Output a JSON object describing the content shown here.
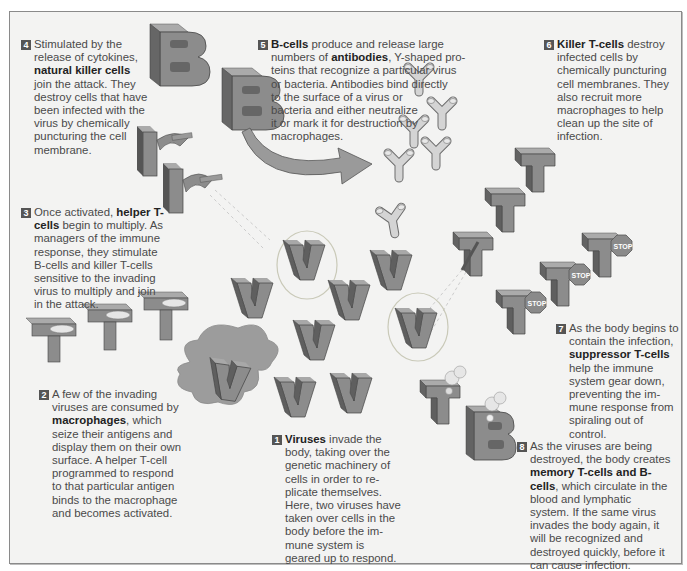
{
  "colors": {
    "background": "#f3f3f2",
    "frame_border": "#8a8a8a",
    "block_face": "#8e8e8e",
    "block_side": "#6a6a6a",
    "block_top": "#a9a9a9",
    "antibody": "#d2d2d2",
    "macrophage": "#9a9a9a",
    "text": "#4a4a4a",
    "bold_text": "#222222"
  },
  "steps": [
    {
      "number": "1",
      "parts": [
        {
          "bold": "Viruses"
        },
        {
          "text": " invade the body, taking over the genetic machinery of cells in order to replicate themselves. Here, two viruses have taken over cells in the body before the immune system is geared up to respond."
        }
      ],
      "lines": [
        "Viruses invade the",
        "body, taking over the",
        "genetic machinery of",
        "cells in order to re-",
        "plicate themselves.",
        "Here, two viruses have",
        "taken over cells in the",
        "body before the im-",
        "mune system is",
        "geared up to respond."
      ]
    },
    {
      "number": "2",
      "lines": [
        "A few of the invading",
        "viruses are consumed by",
        "macrophages, which",
        "seize their antigens and",
        "display them on their own",
        "surface. A helper T-cell",
        "programmed to respond",
        "to that particular antigen",
        "binds to the macrophage",
        "and becomes activated."
      ],
      "bold_term": "macrophages"
    },
    {
      "number": "3",
      "lines": [
        "Once activated, helper T-",
        "cells begin to multiply. As",
        "managers of the immune",
        "response, they stimulate",
        "B-cells and killer T-cells",
        "sensitive to the invading",
        "virus to multiply and join",
        "in the attack."
      ],
      "bold_term": "helper T-cells"
    },
    {
      "number": "4",
      "lines": [
        "Stimulated by the",
        "release of cytokines,",
        "natural killer cells",
        "join the attack. They",
        "destroy cells that have",
        "been infected with the",
        "virus by chemically",
        "puncturing the cell",
        "membrane."
      ],
      "bold_term": "natural killer cells"
    },
    {
      "number": "5",
      "lines": [
        "B-cells produce and release large",
        "numbers of antibodies, Y-shaped pro-",
        "teins that recognize a particular virus",
        "or bacteria. Antibodies bind directly",
        "to the surface of a virus or",
        "bacteria and either neutralize",
        "it or mark it for destruction by",
        "macrophages."
      ],
      "bold_terms": [
        "B-cells",
        "antibodies"
      ]
    },
    {
      "number": "6",
      "lines": [
        "Killer T-cells destroy",
        "infected cells by",
        "chemically puncturing",
        "cell membranes. They",
        "also recruit more",
        "macrophages to help",
        "clean up the site of",
        "infection."
      ],
      "bold_term": "Killer T-cells"
    },
    {
      "number": "7",
      "lines": [
        "As the body begins to",
        "contain the infection,",
        "suppressor T-cells",
        "help the immune",
        "system gear down,",
        "preventing the im-",
        "mune response from",
        "spiraling out of control."
      ],
      "bold_term": "suppressor T-cells"
    },
    {
      "number": "8",
      "lines": [
        "As the viruses are being",
        "destroyed, the body creates",
        "memory T-cells and B-",
        "cells, which circulate in the",
        "blood and lymphatic",
        "system. If the same virus",
        "invades the body again, it",
        "will be recognized and",
        "destroyed quickly, before it",
        "can cause infection."
      ],
      "bold_term": "memory T-cells and B-cells"
    }
  ],
  "text": {
    "s1_b": "Viruses",
    "s1_l1": " invade the",
    "s1_rest": [
      "body, taking over the",
      "genetic machinery of",
      "cells in order to re-",
      "plicate themselves.",
      "Here, two viruses have",
      "taken over cells in the",
      "body before the im-",
      "mune system is",
      "geared up to respond."
    ],
    "s2_l1": "A few of the invading",
    "s2_l2": "viruses are consumed by",
    "s2_b": "macrophages",
    "s2_l3": ", which",
    "s2_rest": [
      "seize their antigens and",
      "display them on their own",
      "surface. A helper T-cell",
      "programmed to respond",
      "to that particular antigen",
      "binds to the macrophage",
      "and becomes activated."
    ],
    "s3_l1": "Once activated, ",
    "s3_b1": "helper T-",
    "s3_b2": "cells",
    "s3_l2": " begin to multiply. As",
    "s3_rest": [
      "managers of the immune",
      "response, they stimulate",
      "B-cells and killer T-cells",
      "sensitive to the invading",
      "virus to multiply and join",
      "in the attack."
    ],
    "s4_l1": "Stimulated by the",
    "s4_l2": "release of cytokines,",
    "s4_b": "natural killer cells",
    "s4_rest": [
      "join the attack. They",
      "destroy cells that have",
      "been infected with the",
      "virus by chemically",
      "puncturing the cell",
      "membrane."
    ],
    "s5_b1": "B-cells",
    "s5_l1": " produce and release large",
    "s5_l2a": "numbers of ",
    "s5_b2": "antibodies",
    "s5_l2b": ", Y-shaped pro-",
    "s5_rest": [
      "teins that recognize a particular virus",
      "or bacteria. Antibodies bind directly",
      "to the surface of a virus or",
      "bacteria and either neutralize",
      "it or mark it for destruction by",
      "macrophages."
    ],
    "s6_b": "Killer T-cells",
    "s6_l1": " destroy",
    "s6_rest": [
      "infected cells by",
      "chemically puncturing",
      "cell membranes. They",
      "also recruit more",
      "macrophages to help",
      "clean up the site of",
      "infection."
    ],
    "s7_l1": "As the body begins to",
    "s7_l2": "contain the infection,",
    "s7_b": "suppressor T-cells",
    "s7_rest": [
      "help the immune",
      "system gear down,",
      "preventing the im-",
      "mune response from",
      "spiraling out of control."
    ],
    "s8_l1": "As the viruses are being",
    "s8_l2": "destroyed, the body creates",
    "s8_b1": "memory T-cells and B-",
    "s8_b2": "cells",
    "s8_l3": ", which circulate in the",
    "s8_rest": [
      "blood and lymphatic",
      "system. If the same virus",
      "invades the body again, it",
      "will be recognized and",
      "destroyed quickly, before it",
      "can cause infection."
    ],
    "stop_label": "STOP",
    "letters": {
      "b_cell": "B",
      "t_cell": "T",
      "virus": "V",
      "nk_cell": "K"
    }
  }
}
